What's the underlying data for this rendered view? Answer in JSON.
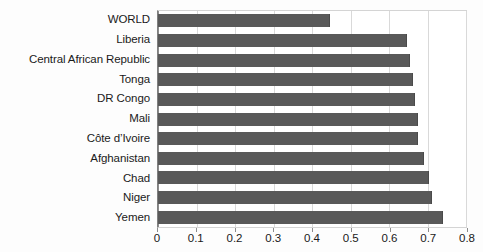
{
  "chart_data": {
    "type": "bar",
    "orientation": "horizontal",
    "title": "",
    "xlabel": "",
    "ylabel": "",
    "xlim": [
      0,
      0.8
    ],
    "xticks": [
      "0",
      "0.1",
      "0.2",
      "0.3",
      "0.4",
      "0.5",
      "0.6",
      "0.7",
      "0.8"
    ],
    "xtick_values": [
      0,
      0.1,
      0.2,
      0.3,
      0.4,
      0.5,
      0.6,
      0.7,
      0.8
    ],
    "grid": "vertical",
    "legend": "none",
    "bar_color": "#595959",
    "categories": [
      "WORLD",
      "Liberia",
      "Central African Republic",
      "Tonga",
      "DR Congo",
      "Mali",
      "Côte d’Ivoire",
      "Afghanistan",
      "Chad",
      "Niger",
      "Yemen"
    ],
    "values": [
      0.448,
      0.648,
      0.655,
      0.662,
      0.668,
      0.675,
      0.676,
      0.69,
      0.705,
      0.712,
      0.74
    ]
  }
}
